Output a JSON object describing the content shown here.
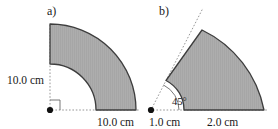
{
  "figure": {
    "width": 278,
    "height": 129,
    "background_color": "#ffffff",
    "shape_fill_color": "#ababab",
    "shape_stroke_color": "#3a3a3a",
    "guide_color": "#7a7a7a",
    "text_color": "#1a1a1a"
  },
  "panels": [
    {
      "id": "a",
      "label": "a)",
      "shape": "quarter-annulus",
      "center": {
        "x": 50,
        "y": 110
      },
      "inner_radius_px": 46,
      "outer_radius_px": 87,
      "start_angle_deg": 0,
      "end_angle_deg": 90,
      "dimensions": [
        {
          "name": "inner-radius-vertical",
          "value": "10.0 cm"
        },
        {
          "name": "annulus-width-horizontal",
          "value": "10.0 cm"
        }
      ],
      "markers": {
        "vertex_dot": true,
        "right_angle_tick": true,
        "dashed_guides": true
      }
    },
    {
      "id": "b",
      "label": "b)",
      "shape": "annular-sector",
      "vertex": {
        "x": 151,
        "y": 110
      },
      "inner_radius_px": 33,
      "outer_radius_px": 113,
      "start_angle_deg": 0,
      "end_angle_deg": 63,
      "angle_marker": "45°",
      "dimensions": [
        {
          "name": "inner-radius",
          "value": "1.0 cm"
        },
        {
          "name": "annulus-width",
          "value": "2.0 cm"
        }
      ],
      "markers": {
        "vertex_dot": true,
        "angle_arc": true,
        "dashed_guides": true
      }
    }
  ],
  "text": {
    "panel_a_label": "a)",
    "panel_b_label": "b)",
    "a_vertical_dim": "10.0 cm",
    "a_horizontal_dim": "10.0 cm",
    "b_inner_dim": "1.0 cm",
    "b_outer_dim": "2.0 cm",
    "b_angle": "45°"
  }
}
